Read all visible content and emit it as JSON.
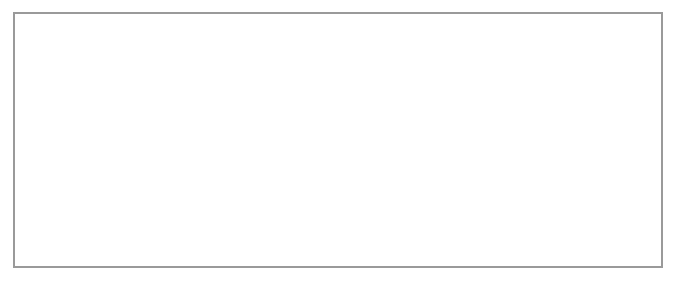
{
  "figure": {
    "title_cutoff": "",
    "frame_color": "#9a9a9a",
    "grid_line_color": "#8a8a8a",
    "border_line_color": "#333333"
  },
  "breadboards": [
    {
      "name": "left-breadboard",
      "columns": [
        "1",
        "2",
        "3",
        "4",
        "5",
        "6",
        "7",
        "8",
        "9",
        "10",
        "11",
        "12",
        "13",
        "14",
        "15",
        "16",
        "17",
        "18",
        "19",
        "20",
        "21",
        "22",
        "23"
      ],
      "rows": [
        "A",
        "B",
        "C",
        "D",
        "E",
        "F",
        "G",
        "H",
        "I",
        "J",
        "K",
        "L",
        "M"
      ],
      "terminals": {
        "top_symbol": "+",
        "bottom_symbol": "−",
        "switch_count": 5
      }
    },
    {
      "name": "right-breadboard",
      "columns": [
        "1",
        "2",
        "3",
        "4",
        "5",
        "6",
        "7",
        "8",
        "9",
        "10",
        "11",
        "12",
        "13",
        "14",
        "15",
        "16",
        "17",
        "18",
        "19",
        "20",
        "21",
        "22",
        "23"
      ],
      "rows": [
        "A",
        "B",
        "C",
        "D",
        "E",
        "F",
        "G",
        "H",
        "I",
        "J",
        "K",
        "L",
        "M"
      ],
      "terminals": {
        "top_symbol": "+",
        "bottom_symbol": "−",
        "switch_count": 5
      }
    }
  ]
}
